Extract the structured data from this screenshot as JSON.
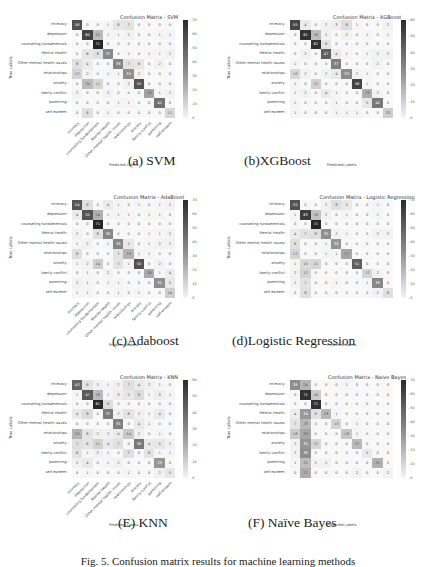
{
  "figure_caption": "Fig. 5. Confusion matrix results for machine learning methods",
  "common": {
    "xlabel": "Predicted Labels",
    "ylabel": "True Labels",
    "labels": [
      "intimacy",
      "depression",
      "counseling fundamentals",
      "Mental Health",
      "Other mental health issues",
      "relationships",
      "anxiety",
      "family-conflict",
      "parenting",
      "self-esteem"
    ]
  },
  "panels": [
    {
      "caption": "(a) SVM",
      "title": "Confusion Matrix - SVM",
      "colorbar_ticks": [
        "70",
        "60",
        "50",
        "40",
        "30",
        "20",
        "10",
        "0"
      ]
    },
    {
      "caption": "(b)XGBoost",
      "title": "Confusion Matrix - XGBoost",
      "colorbar_ticks": [
        "60",
        "50",
        "40",
        "30",
        "20",
        "10",
        "0"
      ]
    },
    {
      "caption": "(c)Adaboost",
      "title": "Confusion Matrix - AdaBoost",
      "colorbar_ticks": [
        "70",
        "60",
        "50",
        "40",
        "30",
        "20",
        "10",
        "0"
      ]
    },
    {
      "caption": "(d)Logistic Regression",
      "title": "Confusion Matrix - Logistic Regression",
      "colorbar_ticks": [
        "70",
        "60",
        "50",
        "40",
        "30",
        "20",
        "10",
        "0"
      ]
    },
    {
      "caption": "(E) KNN",
      "title": "Confusion Matrix - KNN",
      "colorbar_ticks": [
        "60",
        "50",
        "40",
        "30",
        "20",
        "10",
        "0"
      ]
    },
    {
      "caption": "(F) Naïve Bayes",
      "title": "Confusion Matrix - Naive Bayes",
      "colorbar_ticks": [
        "70",
        "60",
        "50",
        "40",
        "30",
        "20",
        "10",
        "0"
      ]
    }
  ],
  "chart_data": [
    {
      "type": "heatmap",
      "title": "Confusion Matrix - SVM",
      "xlabel": "Predicted Labels",
      "ylabel": "True Labels",
      "x": [
        "intimacy",
        "depression",
        "counseling fundamentals",
        "Mental Health",
        "Other mental health issues",
        "relationships",
        "anxiety",
        "family-conflict",
        "parenting",
        "self-esteem"
      ],
      "y": [
        "intimacy",
        "depression",
        "counseling fundamentals",
        "Mental Health",
        "Other mental health issues",
        "relationships",
        "anxiety",
        "family-conflict",
        "parenting",
        "self-esteem"
      ],
      "colorbar_range": [
        0,
        70
      ],
      "values": [
        [
          56,
          0,
          0,
          1,
          6,
          7,
          0,
          0,
          0,
          0
        ],
        [
          0,
          60,
          20,
          1,
          1,
          2,
          0,
          0,
          1,
          1
        ],
        [
          0,
          0,
          71,
          0,
          0,
          0,
          0,
          0,
          0,
          0
        ],
        [
          0,
          6,
          8,
          37,
          0,
          1,
          0,
          1,
          1,
          2
        ],
        [
          8,
          4,
          0,
          0,
          38,
          7,
          6,
          0,
          2,
          0
        ],
        [
          12,
          2,
          0,
          1,
          1,
          35,
          2,
          0,
          0,
          0
        ],
        [
          0,
          20,
          11,
          0,
          0,
          2,
          55,
          0,
          0,
          0
        ],
        [
          2,
          0,
          0,
          2,
          0,
          0,
          0,
          28,
          1,
          2
        ],
        [
          0,
          0,
          0,
          0,
          1,
          1,
          0,
          0,
          45,
          0
        ],
        [
          0,
          8,
          0,
          1,
          0,
          0,
          0,
          0,
          0,
          11
        ]
      ]
    },
    {
      "type": "heatmap",
      "title": "Confusion Matrix - XGBoost",
      "xlabel": "Predicted Labels",
      "ylabel": "True Labels",
      "x": [
        "intimacy",
        "depression",
        "counseling fundamentals",
        "Mental Health",
        "Other mental health issues",
        "relationships",
        "anxiety",
        "family-conflict",
        "parenting",
        "self-esteem"
      ],
      "y": [
        "intimacy",
        "depression",
        "counseling fundamentals",
        "Mental Health",
        "Other mental health issues",
        "relationships",
        "anxiety",
        "family-conflict",
        "parenting",
        "self-esteem"
      ],
      "colorbar_range": [
        0,
        65
      ],
      "values": [
        [
          55,
          4,
          0,
          2,
          3,
          8,
          1,
          0,
          0,
          2
        ],
        [
          0,
          61,
          18,
          2,
          0,
          2,
          0,
          1,
          0,
          1
        ],
        [
          0,
          0,
          62,
          6,
          0,
          0,
          0,
          0,
          0,
          0
        ],
        [
          0,
          2,
          0,
          47,
          4,
          1,
          0,
          1,
          2,
          2
        ],
        [
          1,
          0,
          0,
          0,
          37,
          0,
          0,
          0,
          2,
          0
        ],
        [
          10,
          2,
          0,
          2,
          4,
          33,
          2,
          1,
          0,
          0
        ],
        [
          1,
          0,
          12,
          0,
          0,
          0,
          56,
          1,
          0,
          0
        ],
        [
          1,
          2,
          0,
          4,
          1,
          0,
          0,
          23,
          2,
          0
        ],
        [
          1,
          0,
          0,
          0,
          1,
          0,
          0,
          5,
          40,
          0
        ],
        [
          1,
          0,
          0,
          0,
          1,
          1,
          1,
          0,
          0,
          13
        ]
      ]
    },
    {
      "type": "heatmap",
      "title": "Confusion Matrix - AdaBoost",
      "xlabel": "Predicted Labels",
      "ylabel": "True Labels",
      "x": [
        "intimacy",
        "depression",
        "counseling fundamentals",
        "Mental Health",
        "Other mental health issues",
        "relationships",
        "anxiety",
        "family-conflict",
        "parenting",
        "self-esteem"
      ],
      "y": [
        "intimacy",
        "depression",
        "counseling fundamentals",
        "Mental Health",
        "Other mental health issues",
        "relationships",
        "anxiety",
        "family-conflict",
        "parenting",
        "self-esteem"
      ],
      "colorbar_range": [
        0,
        70
      ],
      "values": [
        [
          54,
          8,
          0,
          4,
          1,
          0,
          1,
          0,
          1,
          2
        ],
        [
          4,
          55,
          24,
          1,
          1,
          1,
          0,
          1,
          1,
          0
        ],
        [
          0,
          0,
          71,
          0,
          0,
          0,
          0,
          0,
          0,
          0
        ],
        [
          2,
          0,
          8,
          38,
          0,
          0,
          0,
          1,
          1,
          2
        ],
        [
          1,
          2,
          0,
          1,
          38,
          5,
          0,
          1,
          2,
          2
        ],
        [
          8,
          0,
          0,
          0,
          7,
          23,
          1,
          1,
          0,
          0
        ],
        [
          1,
          2,
          14,
          0,
          7,
          1,
          55,
          0,
          2,
          0
        ],
        [
          0,
          1,
          0,
          2,
          0,
          0,
          0,
          26,
          1,
          4
        ],
        [
          2,
          1,
          0,
          1,
          1,
          0,
          0,
          0,
          35,
          5
        ],
        [
          1,
          1,
          0,
          0,
          1,
          0,
          1,
          0,
          0,
          14
        ]
      ]
    },
    {
      "type": "heatmap",
      "title": "Confusion Matrix - Logistic Regression",
      "xlabel": "Predicted Labels",
      "ylabel": "True Labels",
      "x": [
        "intimacy",
        "depression",
        "counseling fundamentals",
        "Mental Health",
        "Other mental health issues",
        "relationships",
        "anxiety",
        "family-conflict",
        "parenting",
        "self-esteem"
      ],
      "y": [
        "intimacy",
        "depression",
        "counseling fundamentals",
        "Mental Health",
        "Other mental health issues",
        "relationships",
        "anxiety",
        "family-conflict",
        "parenting",
        "self-esteem"
      ],
      "colorbar_range": [
        0,
        70
      ],
      "values": [
        [
          55,
          0,
          0,
          2,
          8,
          5,
          0,
          0,
          1,
          0
        ],
        [
          1,
          63,
          18,
          2,
          0,
          1,
          0,
          0,
          1,
          0
        ],
        [
          0,
          0,
          71,
          0,
          0,
          0,
          0,
          0,
          0,
          0
        ],
        [
          4,
          7,
          8,
          35,
          2,
          1,
          0,
          0,
          2,
          2
        ],
        [
          8,
          0,
          0,
          1,
          33,
          0,
          0,
          0,
          0,
          0
        ],
        [
          12,
          0,
          0,
          1,
          1,
          27,
          0,
          0,
          0,
          0
        ],
        [
          1,
          10,
          11,
          0,
          0,
          0,
          51,
          0,
          0,
          0
        ],
        [
          2,
          12,
          0,
          0,
          0,
          0,
          0,
          12,
          2,
          0
        ],
        [
          2,
          7,
          0,
          0,
          1,
          0,
          0,
          1,
          38,
          0
        ],
        [
          0,
          8,
          0,
          0,
          0,
          0,
          0,
          0,
          2,
          8
        ]
      ]
    },
    {
      "type": "heatmap",
      "title": "Confusion Matrix - KNN",
      "xlabel": "Predicted Labels",
      "ylabel": "True Labels",
      "x": [
        "intimacy",
        "depression",
        "counseling fundamentals",
        "Mental Health",
        "Other mental health issues",
        "relationships",
        "anxiety",
        "family-conflict",
        "parenting",
        "self-esteem"
      ],
      "y": [
        "intimacy",
        "depression",
        "counseling fundamentals",
        "Mental Health",
        "Other mental health issues",
        "relationships",
        "anxiety",
        "family-conflict",
        "parenting",
        "self-esteem"
      ],
      "colorbar_range": [
        0,
        62
      ],
      "values": [
        [
          43,
          6,
          2,
          1,
          2,
          7,
          4,
          2,
          1,
          0
        ],
        [
          1,
          47,
          18,
          1,
          3,
          5,
          8,
          1,
          3,
          1
        ],
        [
          0,
          0,
          61,
          8,
          0,
          0,
          0,
          0,
          0,
          0
        ],
        [
          4,
          8,
          0,
          37,
          2,
          6,
          2,
          1,
          4,
          0
        ],
        [
          0,
          0,
          0,
          0,
          35,
          0,
          4,
          1,
          0,
          0
        ],
        [
          20,
          6,
          2,
          2,
          4,
          14,
          2,
          0,
          1,
          0
        ],
        [
          7,
          6,
          11,
          4,
          7,
          0,
          38,
          4,
          5,
          2
        ],
        [
          6,
          1,
          2,
          1,
          0,
          7,
          0,
          6,
          1,
          1
        ],
        [
          2,
          4,
          0,
          1,
          2,
          0,
          0,
          0,
          29,
          0
        ],
        [
          0,
          1,
          0,
          0,
          0,
          1,
          0,
          0,
          2,
          5
        ]
      ]
    },
    {
      "type": "heatmap",
      "title": "Confusion Matrix - Naive Bayes",
      "xlabel": "Predicted Labels",
      "ylabel": "True Labels",
      "x": [
        "intimacy",
        "depression",
        "counseling fundamentals",
        "Mental Health",
        "Other mental health issues",
        "relationships",
        "anxiety",
        "family-conflict",
        "parenting",
        "self-esteem"
      ],
      "y": [
        "intimacy",
        "depression",
        "counseling fundamentals",
        "Mental Health",
        "Other mental health issues",
        "relationships",
        "anxiety",
        "family-conflict",
        "parenting",
        "self-esteem"
      ],
      "colorbar_range": [
        0,
        75
      ],
      "values": [
        [
          38,
          24,
          0,
          0,
          0,
          1,
          0,
          0,
          0,
          0
        ],
        [
          0,
          71,
          16,
          0,
          0,
          0,
          0,
          0,
          0,
          0
        ],
        [
          0,
          0,
          71,
          0,
          0,
          0,
          0,
          0,
          0,
          0
        ],
        [
          4,
          34,
          8,
          23,
          1,
          0,
          0,
          0,
          0,
          0
        ],
        [
          7,
          23,
          0,
          0,
          13,
          0,
          1,
          0,
          0,
          0
        ],
        [
          16,
          29,
          0,
          0,
          0,
          18,
          1,
          0,
          0,
          0
        ],
        [
          2,
          35,
          12,
          0,
          0,
          0,
          22,
          0,
          0,
          0
        ],
        [
          2,
          38,
          0,
          0,
          0,
          0,
          0,
          5,
          0,
          0
        ],
        [
          1,
          21,
          2,
          2,
          0,
          0,
          0,
          0,
          25,
          0
        ],
        [
          0,
          27,
          0,
          0,
          0,
          0,
          2,
          0,
          0,
          2
        ]
      ]
    }
  ]
}
